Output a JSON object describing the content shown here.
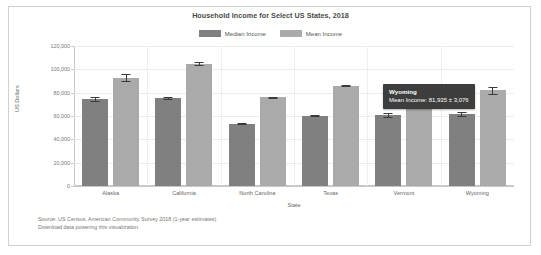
{
  "chart_data": {
    "type": "bar",
    "title": "Household Income for Select US States, 2018",
    "xlabel": "State",
    "ylabel": "US Dollars",
    "ylim": [
      0,
      120000
    ],
    "yticks": [
      "0",
      "20,000",
      "40,000",
      "60,000",
      "80,000",
      "100,000",
      "120,000"
    ],
    "ytick_values": [
      0,
      20000,
      40000,
      60000,
      80000,
      100000,
      120000
    ],
    "grid": true,
    "legend_position": "top-center",
    "categories": [
      "Alaska",
      "California",
      "North Carolina",
      "Texas",
      "Vermont",
      "Wyoming"
    ],
    "series": [
      {
        "name": "Median Income",
        "color": "#808080",
        "values": [
          74500,
          75300,
          53300,
          60100,
          60800,
          61600
        ],
        "errors": [
          1800,
          700,
          500,
          400,
          1400,
          1500
        ]
      },
      {
        "name": "Mean Income",
        "color": "#aaaaaa",
        "values": [
          93000,
          105000,
          76000,
          86000,
          82000,
          81935
        ],
        "errors": [
          2600,
          900,
          700,
          600,
          2400,
          3076
        ]
      }
    ]
  },
  "chart": {
    "title": "Household Income for Select US States, 2018",
    "xaxis_title": "State",
    "yaxis_title": "US Dollars",
    "legend": [
      {
        "label": "Median Income",
        "color": "#808080"
      },
      {
        "label": "Mean Income",
        "color": "#aaaaaa"
      }
    ],
    "yticks": [
      "120,000",
      "100,000",
      "80,000",
      "60,000",
      "40,000",
      "20,000",
      "0"
    ],
    "xlabels": [
      "Alaska",
      "California",
      "North Carolina",
      "Texas",
      "Vermont",
      "Wyoming"
    ]
  },
  "tooltip": {
    "title": "Wyoming",
    "body": "Mean Income: 81,935 ± 3,076"
  },
  "footer": {
    "source": "Source: US Census, American Community Survey 2018 (1-year estimates)",
    "download_link": "Download data powering this visualization."
  }
}
